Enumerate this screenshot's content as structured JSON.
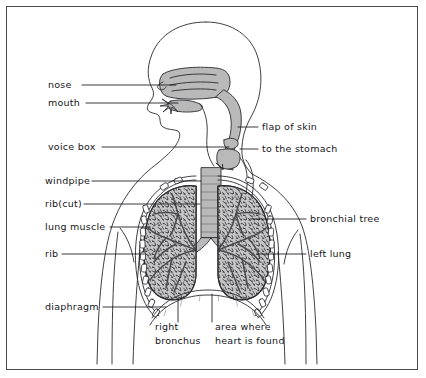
{
  "diagram": {
    "view": "frontal torso with head in left profile",
    "border_color": "#4a4a4a",
    "background_color": "#ffffff",
    "line_color": "#2a2a2e",
    "tissue_fill": "#b9b9b9",
    "lung_fill": "#c6c6c6",
    "label_color": "#16161a"
  },
  "labels": {
    "left": [
      {
        "id": "nose",
        "text": "nose",
        "x": 48,
        "y": 88,
        "leader_to_x": 176,
        "leader_to_y": 88
      },
      {
        "id": "mouth",
        "text": "mouth",
        "x": 48,
        "y": 106,
        "leader_to_x": 178,
        "leader_to_y": 104
      },
      {
        "id": "voice-box",
        "text": "voice box",
        "x": 48,
        "y": 150,
        "leader_to_x": 229,
        "leader_to_y": 143
      },
      {
        "id": "windpipe",
        "text": "windpipe",
        "x": 45,
        "y": 184,
        "leader_to_x": 212,
        "leader_to_y": 184
      },
      {
        "id": "rib-cut",
        "text": "rib(cut)",
        "x": 45,
        "y": 207,
        "leader_to_x": 200,
        "leader_to_y": 207
      },
      {
        "id": "lung-muscle",
        "text": "lung muscle",
        "x": 45,
        "y": 230,
        "leader_to_x": 162,
        "leader_to_y": 230
      },
      {
        "id": "rib",
        "text": "rib",
        "x": 45,
        "y": 257,
        "leader_to_x": 155,
        "leader_to_y": 257
      },
      {
        "id": "diaphragm",
        "text": "diaphragm",
        "x": 45,
        "y": 310,
        "leader_to_x": 166,
        "leader_to_y": 310
      }
    ],
    "right": [
      {
        "id": "flap-of-skin",
        "text": "flap of skin",
        "x": 262,
        "y": 130,
        "leader_to_x": 238,
        "leader_to_y": 137
      },
      {
        "id": "to-the-stomach",
        "text": "to the stomach",
        "x": 262,
        "y": 152,
        "leader_to_x": 240,
        "leader_to_y": 158
      },
      {
        "id": "bronchial-tree",
        "text": "bronchial tree",
        "x": 310,
        "y": 222,
        "leader_to_x": 258,
        "leader_to_y": 222
      },
      {
        "id": "left-lung",
        "text": "left lung",
        "x": 310,
        "y": 257,
        "leader_to_x": 268,
        "leader_to_y": 257
      }
    ],
    "bottom": [
      {
        "id": "right-bronchus",
        "line1": "right",
        "line2": "bronchus",
        "x": 155,
        "y": 330,
        "leader_to_x": 178,
        "leader_to_y": 300
      },
      {
        "id": "heart-area",
        "line1": "area where",
        "line2": "heart is found",
        "x": 215,
        "y": 330,
        "leader_to_x": 213,
        "leader_to_y": 296
      }
    ]
  },
  "anatomy_parts": [
    "nasal cavity",
    "mouth",
    "tongue",
    "epiglottis (flap of skin)",
    "larynx (voice box)",
    "esophagus (to the stomach)",
    "trachea (windpipe)",
    "right bronchus",
    "left bronchus",
    "bronchial tree",
    "right lung",
    "left lung",
    "ribs",
    "cut rib",
    "intercostal lung muscle",
    "diaphragm",
    "area where heart is found"
  ]
}
